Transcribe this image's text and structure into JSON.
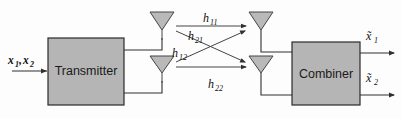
{
  "diagram": {
    "background_color": "#fdfdfd",
    "block_fill_color": "#b5b5b5",
    "block_stroke_color": "#2b2b2b",
    "wire_color": "#303030",
    "antenna_fill_color": "#b9b9b9"
  },
  "blocks": {
    "transmitter": {
      "label": "Transmitter"
    },
    "combiner": {
      "label": "Combiner"
    }
  },
  "inputs": {
    "signal": {
      "base": "x",
      "sub1": "1",
      "comma": ",",
      "base2": "x",
      "sub2": "2",
      "text": "x1,x2"
    }
  },
  "outputs": {
    "out1": {
      "base": "x̃",
      "sub": "1",
      "text": "x̃1"
    },
    "out2": {
      "base": "x̃",
      "sub": "2",
      "text": "x̃2"
    }
  },
  "channels": [
    {
      "name": "h11",
      "base": "h",
      "sub": "11"
    },
    {
      "name": "h21",
      "base": "h",
      "sub": "21"
    },
    {
      "name": "h12",
      "base": "h",
      "sub": "12"
    },
    {
      "name": "h22",
      "base": "h",
      "sub": "22"
    }
  ],
  "antennas": {
    "tx1": {
      "name": "transmit-antenna-1"
    },
    "tx2": {
      "name": "transmit-antenna-2"
    },
    "rx1": {
      "name": "receive-antenna-1"
    },
    "rx2": {
      "name": "receive-antenna-2"
    }
  }
}
